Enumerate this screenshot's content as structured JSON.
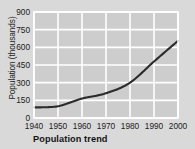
{
  "chart_data": {
    "type": "line",
    "title": "Population trend",
    "xlabel": "",
    "ylabel": "Population (thousands)",
    "x": [
      1940,
      1950,
      1960,
      1970,
      1980,
      1990,
      2000
    ],
    "values": [
      90,
      100,
      165,
      210,
      300,
      480,
      655
    ],
    "series": [
      {
        "name": "Population",
        "values": [
          90,
          100,
          165,
          210,
          300,
          480,
          655
        ]
      }
    ],
    "xticks": [
      "1940",
      "1950",
      "1960",
      "1970",
      "1980",
      "1990",
      "2000"
    ],
    "yticks": [
      "0",
      "150",
      "300",
      "450",
      "600",
      "750",
      "900"
    ],
    "xlim": [
      1940,
      2000
    ],
    "ylim": [
      0,
      900
    ],
    "grid": true,
    "legend": "none",
    "line_color": "#2b2b2b",
    "plot_bg": "#cdcdcd",
    "figure_bg": "#d9d9d9",
    "grid_color": "#ffffff"
  }
}
